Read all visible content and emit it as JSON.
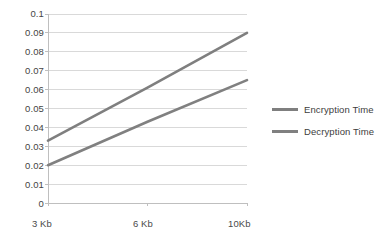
{
  "chart_data": {
    "type": "line",
    "title": "",
    "xlabel": "",
    "ylabel": "",
    "categories": [
      "3 Kb",
      "6 Kb",
      "10Kb"
    ],
    "x_tick_labels": [
      "3 Kb",
      "6 Kb",
      "10Kb"
    ],
    "y_tick_labels": [
      "0",
      "0.01",
      "0.02",
      "0.03",
      "0.04",
      "0.05",
      "0.06",
      "0.07",
      "0.08",
      "0.09",
      "0.1"
    ],
    "y_tick_values": [
      0,
      0.01,
      0.02,
      0.03,
      0.04,
      0.05,
      0.06,
      0.07,
      0.08,
      0.09,
      0.1
    ],
    "ylim": [
      0,
      0.1
    ],
    "grid": "horizontal",
    "legend_position": "right",
    "series": [
      {
        "name": "Encryption Time",
        "color": "#7f7f7f",
        "values": [
          0.033,
          0.061,
          0.09
        ]
      },
      {
        "name": "Decryption Time",
        "color": "#808080",
        "values": [
          0.02,
          0.043,
          0.065
        ]
      }
    ]
  },
  "legend": {
    "items": [
      {
        "label": "Encryption Time"
      },
      {
        "label": "Decryption Time"
      }
    ]
  },
  "colors": {
    "background": "#ffffff",
    "gridline": "#d9d9d9",
    "axis": "#bfbfbf",
    "series_1": "#7f7f7f",
    "series_2": "#808080",
    "tick_text": "#444444"
  }
}
